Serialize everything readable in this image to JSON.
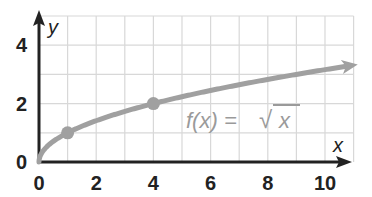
{
  "chart_data": {
    "type": "line",
    "title": "",
    "xlabel": "x",
    "ylabel": "y",
    "xlim": [
      0,
      11
    ],
    "ylim": [
      0,
      5
    ],
    "grid": true,
    "x_ticks": [
      "0",
      "2",
      "4",
      "6",
      "8",
      "10"
    ],
    "y_ticks": [
      "0",
      "2",
      "4"
    ],
    "series": [
      {
        "name": "f(x) = √x",
        "function": "sqrt(x)",
        "x": [
          0,
          1,
          2,
          3,
          4,
          5,
          6,
          7,
          8,
          9,
          10,
          10.8
        ],
        "values": [
          0,
          1,
          1.41,
          1.73,
          2,
          2.24,
          2.45,
          2.65,
          2.83,
          3,
          3.16,
          3.29
        ],
        "color": "#a0a0a0",
        "arrow_end": true
      }
    ],
    "highlighted_points": [
      {
        "x": 1,
        "y": 1
      },
      {
        "x": 4,
        "y": 2
      }
    ],
    "annotations": [
      {
        "text": "f(x) = √x",
        "x": 5.5,
        "y": 1.4
      }
    ]
  },
  "labels": {
    "x_axis": "x",
    "y_axis": "y",
    "function_prefix": "f(x) = ",
    "function_root": "√",
    "function_arg": "x"
  },
  "colors": {
    "grid": "#d8d8d8",
    "axis": "#222222",
    "curve": "#a0a0a0",
    "points": "#a0a0a0"
  }
}
